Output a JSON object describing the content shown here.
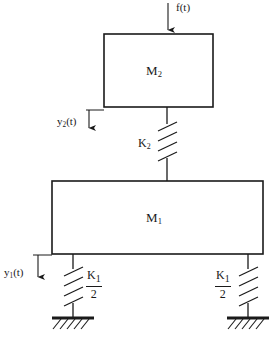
{
  "diagram": {
    "type": "mechanical-schematic",
    "background_color": "#ffffff",
    "line_color": "#1a1a1a",
    "masses": [
      {
        "id": "m2",
        "label": "M",
        "subscript": "2",
        "x": 104,
        "y": 34,
        "width": 109,
        "height": 73
      },
      {
        "id": "m1",
        "label": "M",
        "subscript": "1",
        "x": 52,
        "y": 181,
        "width": 211,
        "height": 73
      }
    ],
    "force": {
      "label": "f(t)",
      "direction": "down",
      "applied_to": "m2",
      "arrow_x": 168,
      "arrow_y_start": 3,
      "arrow_y_end": 34
    },
    "displacements": [
      {
        "id": "y2",
        "label": "y",
        "subscript": "2",
        "suffix": "(t)",
        "direction": "down",
        "reference": "m2",
        "arrow_x": 89,
        "arrow_y_start": 110,
        "arrow_y_end": 132
      },
      {
        "id": "y1",
        "label": "y",
        "subscript": "1",
        "suffix": "(t)",
        "direction": "down",
        "reference": "m1",
        "arrow_x": 38,
        "arrow_y_start": 255,
        "arrow_y_end": 281
      }
    ],
    "springs": [
      {
        "id": "k2",
        "label": "K",
        "subscript": "2",
        "denominator": null,
        "x": 167,
        "y_top": 107,
        "y_bottom": 181,
        "coil_count": 4,
        "label_side": "left",
        "connects": [
          "m2",
          "m1"
        ]
      },
      {
        "id": "k1-left",
        "label": "K",
        "subscript": "1",
        "denominator": "2",
        "x": 73,
        "y_top": 254,
        "y_bottom": 318,
        "coil_count": 4,
        "label_side": "right",
        "connects": [
          "m1",
          "ground-left"
        ]
      },
      {
        "id": "k1-right",
        "label": "K",
        "subscript": "1",
        "denominator": "2",
        "x": 248,
        "y_top": 254,
        "y_bottom": 318,
        "coil_count": 4,
        "label_side": "left",
        "connects": [
          "m1",
          "ground-right"
        ]
      }
    ],
    "grounds": [
      {
        "id": "ground-left",
        "center_x": 73,
        "y": 318,
        "width": 42
      },
      {
        "id": "ground-right",
        "center_x": 248,
        "y": 318,
        "width": 42
      }
    ]
  }
}
